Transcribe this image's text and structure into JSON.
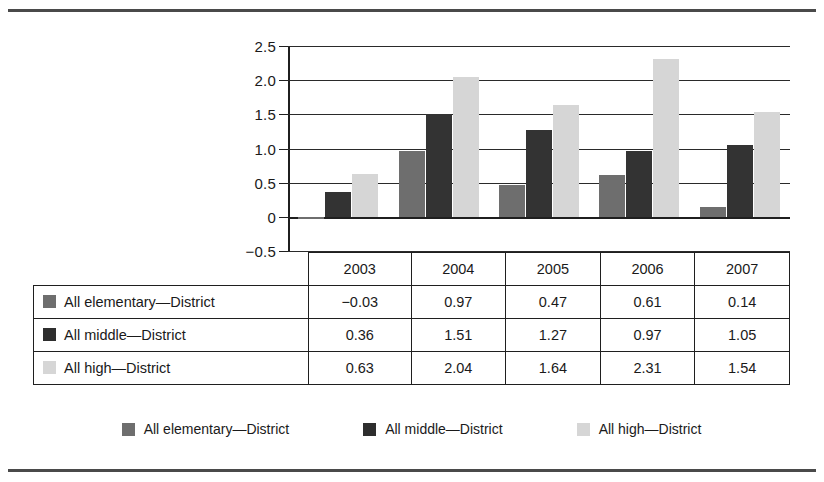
{
  "chart_data": {
    "type": "bar",
    "title": "",
    "xlabel": "",
    "ylabel": "",
    "categories": [
      "2003",
      "2004",
      "2005",
      "2006",
      "2007"
    ],
    "series": [
      {
        "name": "All elementary—District",
        "color": "#6e6e6e",
        "values": [
          -0.03,
          0.97,
          0.47,
          0.61,
          0.14
        ]
      },
      {
        "name": "All middle—District",
        "color": "#333333",
        "values": [
          0.36,
          1.51,
          1.27,
          0.97,
          1.05
        ]
      },
      {
        "name": "All high—District",
        "color": "#d6d6d6",
        "values": [
          0.63,
          2.04,
          1.64,
          2.31,
          1.54
        ]
      }
    ],
    "ylim": [
      -0.5,
      2.5
    ],
    "ytick_values": [
      2.5,
      2.0,
      1.5,
      1.0,
      0.5,
      0,
      -0.5
    ],
    "ytick_labels": [
      "2.5",
      "2.0",
      "1.5",
      "1.0",
      "0.5",
      "0",
      "−0.5"
    ],
    "grid": true,
    "legend_position": "bottom"
  },
  "table": {
    "corner_label": "",
    "column_headers": [
      "2003",
      "2004",
      "2005",
      "2006",
      "2007"
    ],
    "rows": [
      {
        "label": "All elementary—District",
        "swatch": "#6e6e6e",
        "values": [
          "−0.03",
          "0.97",
          "0.47",
          "0.61",
          "0.14"
        ]
      },
      {
        "label": "All middle—District",
        "swatch": "#2e2e2e",
        "values": [
          "0.36",
          "1.51",
          "1.27",
          "0.97",
          "1.05"
        ]
      },
      {
        "label": "All high—District",
        "swatch": "#d6d6d6",
        "values": [
          "0.63",
          "2.04",
          "1.64",
          "2.31",
          "1.54"
        ]
      }
    ]
  },
  "legend": {
    "items": [
      {
        "label": "All elementary—District",
        "swatch": "#6e6e6e"
      },
      {
        "label": "All middle—District",
        "swatch": "#2e2e2e"
      },
      {
        "label": "All high—District",
        "swatch": "#d6d6d6"
      }
    ]
  }
}
